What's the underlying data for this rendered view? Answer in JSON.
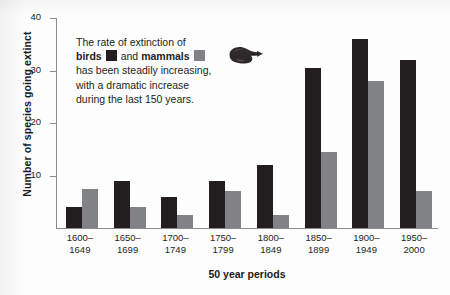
{
  "chart_data": {
    "type": "bar",
    "title": "",
    "xlabel": "50 year periods",
    "ylabel": "Number of species going extinct",
    "ylim": [
      0,
      40
    ],
    "yticks": [
      10,
      20,
      30,
      40
    ],
    "grid": false,
    "legend_position": "inline-annotation",
    "categories": [
      "1600–1649",
      "1650–1699",
      "1700–1749",
      "1750–1799",
      "1800–1849",
      "1850–1899",
      "1900–1949",
      "1950–2000"
    ],
    "category_lines": [
      [
        "1600–",
        "1649"
      ],
      [
        "1650–",
        "1699"
      ],
      [
        "1700–",
        "1749"
      ],
      [
        "1750–",
        "1799"
      ],
      [
        "1800–",
        "1849"
      ],
      [
        "1850–",
        "1899"
      ],
      [
        "1900–",
        "1949"
      ],
      [
        "1950–",
        "2000"
      ]
    ],
    "series": [
      {
        "name": "birds",
        "color": "#231f20",
        "values": [
          4,
          9,
          6,
          9,
          12,
          30.5,
          36,
          32
        ]
      },
      {
        "name": "mammals",
        "color": "#808285",
        "values": [
          7.5,
          4,
          2.5,
          7,
          2.5,
          14.5,
          28,
          7
        ]
      }
    ]
  },
  "axes": {
    "y_title": "Number of species going extinct",
    "x_title": "50 year periods",
    "y_tick_labels": [
      "40",
      "30",
      "20",
      "10"
    ]
  },
  "annotation": {
    "line1_text": "The rate of extinction of",
    "line2_prefix": "",
    "line2_bold1": "birds",
    "line2_middle": "and",
    "line2_bold2": "mammals",
    "line3_text": "has been steadily increasing,",
    "line4_text": "with a dramatic increase",
    "line5_text": "during the last 150 years.",
    "hand_icon": "pointing-hand-icon"
  },
  "colors": {
    "birds": "#231f20",
    "mammals": "#808285",
    "axis": "#8c8c8c",
    "background": "#fdfdfd"
  }
}
